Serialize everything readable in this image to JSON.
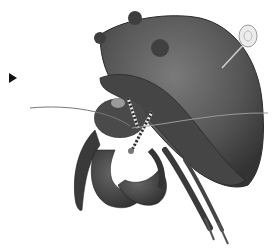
{
  "image": {
    "subject": "hermit crab illustration",
    "description": "Grayscale illustration of a hairy hermit crab emerging from a moss-covered shell, with long antennae, striped eye stalks, large claws and walking legs; a pin with a round head is stuck in the top of the shell.",
    "colors": {
      "background": "#ffffff",
      "shell": "#5a5a5a",
      "shell_dark": "#3a3a3a",
      "body": "#4a4a4a",
      "pin_head": "#e8e8e8",
      "marker": "#111111"
    }
  },
  "marker": {
    "icon": "play-arrow-icon"
  }
}
